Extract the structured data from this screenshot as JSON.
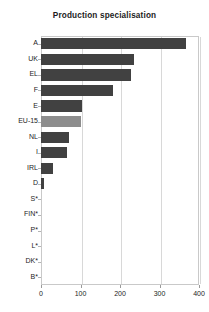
{
  "chart_data": {
    "type": "bar",
    "orientation": "horizontal",
    "title": "Production specialisation",
    "xlabel": "",
    "ylabel": "",
    "categories": [
      "A",
      "UK",
      "EL",
      "F",
      "E",
      "EU-15",
      "NL",
      "I",
      "IRL",
      "D",
      "S*",
      "FIN*",
      "P*",
      "L*",
      "DK*",
      "B*"
    ],
    "values": [
      367,
      236,
      228,
      182,
      103,
      101,
      70,
      67,
      31,
      8,
      0,
      0,
      0,
      0,
      0,
      0
    ],
    "xlim": [
      0,
      400
    ],
    "xticks": [
      0,
      100,
      200,
      300,
      400
    ],
    "xtick_labels": [
      "0",
      "100",
      "200",
      "300",
      "400"
    ],
    "grid": "vertical",
    "legend": "none",
    "series": [
      {
        "name": "Production specialisation",
        "values": [
          367,
          236,
          228,
          182,
          103,
          101,
          70,
          67,
          31,
          8,
          0,
          0,
          0,
          0,
          0,
          0
        ]
      }
    ],
    "colors": {
      "bar": "#414141",
      "bar_highlight": "#8d8d8d",
      "grid": "#d8d8d8",
      "frame": "#c9c9c9",
      "text": "#242424"
    },
    "highlight_category": "EU-15",
    "annotations": []
  }
}
